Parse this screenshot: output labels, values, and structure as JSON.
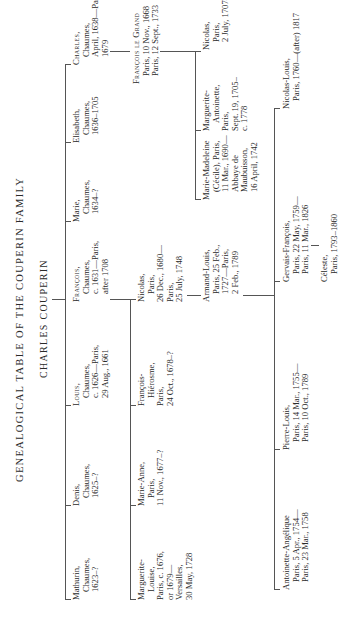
{
  "title": "GENEALOGICAL TABLE OF THE COUPERIN FAMILY",
  "root": "CHARLES COUPERIN",
  "generation1": [
    {
      "name": "Mathurin,",
      "lines": [
        "Chaumes,",
        "1623–?"
      ]
    },
    {
      "name": "Denis,",
      "lines": [
        "Chaumes,",
        "1625–?"
      ]
    },
    {
      "name": "Louis,",
      "lines": [
        "Chaumes,",
        "c. 1626—Paris,",
        "29 Aug., 1661"
      ]
    },
    {
      "name": "François,",
      "lines": [
        "Chaumes,",
        "c. 1631—Paris,",
        "after 1708"
      ]
    },
    {
      "name": "Marie,",
      "lines": [
        "Chaumes,",
        "1634–?"
      ]
    },
    {
      "name": "Elisabeth,",
      "lines": [
        "Chaumes,",
        "1636–1705"
      ]
    },
    {
      "name": "Charles,",
      "lines": [
        "Chaumes,",
        "April, 1638—Paris,",
        "1679"
      ]
    }
  ],
  "francois_le_grand": {
    "name": "François le Grand",
    "lines": [
      "Paris, 10 Nov., 1668",
      "Paris, 12 Sept., 1733"
    ]
  },
  "generation2_francois": [
    {
      "name": "Marguerite-",
      "lines": [
        "Louise,",
        "Paris, c. 1676,",
        "or 1679—",
        "Versailles,",
        "30 May, 1728"
      ]
    },
    {
      "name": "Marie-Anne,",
      "lines": [
        "Paris,",
        "11 Nov., 1677–?"
      ]
    },
    {
      "name": "François-",
      "lines": [
        "Hiérosme,",
        "Paris,",
        "24 Oct., 1678–?"
      ]
    },
    {
      "name": "Nicolas,",
      "lines": [
        "Paris,",
        "26 Dec., 1680—",
        "Paris,",
        "25 July, 1748"
      ]
    }
  ],
  "generation2_legrand": [
    {
      "name": "Marie-Madeleine",
      "lines": [
        "(Cécile), Paris,",
        "11 Mar., 1690—",
        "Abbaye de",
        "Maubuisson,",
        "16 April, 1742"
      ]
    },
    {
      "name": "Marguerite-",
      "lines": [
        "Antoinette,",
        "Paris,",
        "Sept. 19, 1705–",
        "c. 1778"
      ]
    },
    {
      "name": "Nicolas,",
      "lines": [
        "Paris,",
        "2 July, 1707–?"
      ]
    }
  ],
  "armand_louis": {
    "name": "Armand-Louis,",
    "lines": [
      "Paris, 25 Feb.,",
      "1727—Paris,",
      "2 Feb., 1789"
    ]
  },
  "generation3": [
    {
      "name": "Antoinette-Angélique",
      "lines": [
        "Paris, 5 Apr., 1754—",
        "Paris, 23 Mar., 1758"
      ]
    },
    {
      "name": "Pierre-Louis,",
      "lines": [
        "Paris, 14 Mar., 1755—",
        "Paris, 10 Oct., 1789"
      ]
    },
    {
      "name": "Gervais-François,",
      "lines": [
        "Paris, 22 May, 1759—",
        "Paris, 11 Mar., 1826"
      ]
    },
    {
      "name": "Nicolas-Louis,",
      "lines": [
        "Paris, 1760—(after) 1817"
      ]
    }
  ],
  "celeste": {
    "name": "Céleste,",
    "lines": [
      "Paris, 1793–1860"
    ]
  }
}
